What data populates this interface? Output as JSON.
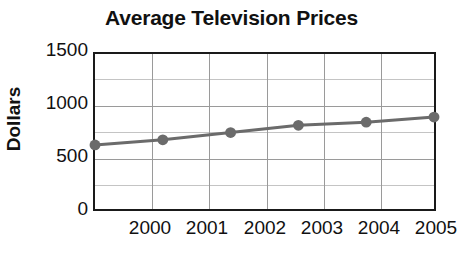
{
  "chart_data": {
    "type": "line",
    "title": "Average Television Prices",
    "xlabel": "",
    "ylabel": "Dollars",
    "categories": [
      "2000",
      "2001",
      "2002",
      "2003",
      "2004",
      "2005"
    ],
    "x": [
      2000,
      2001,
      2002,
      2003,
      2004,
      2005
    ],
    "values": [
      620,
      670,
      740,
      810,
      840,
      890
    ],
    "series": [
      {
        "name": "Average Television Price",
        "values": [
          620,
          670,
          740,
          810,
          840,
          890
        ],
        "color": "#6b6b6b",
        "marker": "circle"
      }
    ],
    "ylim": [
      0,
      1500
    ],
    "y_ticks": [
      0,
      500,
      1000,
      1500
    ],
    "y_tick_labels": [
      "0",
      "500",
      "1000",
      "1500"
    ],
    "y_minor_ticks": [
      250,
      750,
      1250
    ],
    "grid": {
      "horizontal": true,
      "vertical": true,
      "minor_horizontal": true
    },
    "legend": null,
    "legend_position": "none"
  },
  "axes": {
    "y_labels": [
      "1500",
      "1000",
      "500",
      "0"
    ],
    "x_labels": [
      "2000",
      "2001",
      "2002",
      "2003",
      "2004",
      "2005"
    ]
  },
  "colors": {
    "series_line": "#6b6b6b",
    "marker": "#6b6b6b",
    "axis_border": "#1a1a1a",
    "gridline_major": "#9a9a9a",
    "gridline_minor": "#c4c4c4",
    "text": "#111111",
    "background": "#ffffff"
  }
}
